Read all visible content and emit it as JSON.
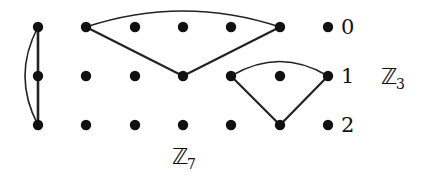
{
  "diagram": {
    "colors": {
      "background": "#ffffff",
      "ink": "#111111",
      "edge": "#222222"
    },
    "grid": {
      "columns_x": [
        38,
        86,
        135,
        183,
        231,
        280,
        328
      ],
      "rows_y": [
        27,
        76,
        125
      ],
      "dot_radius": 5.2
    },
    "row_labels": [
      "0",
      "1",
      "2"
    ],
    "group_labels": {
      "rows_group": {
        "symbol": "ℤ",
        "subscript": "3"
      },
      "columns_group": {
        "symbol": "ℤ",
        "subscript": "7"
      }
    },
    "edges": [
      {
        "type": "line",
        "from": [
          0,
          0
        ],
        "to": [
          0,
          1
        ]
      },
      {
        "type": "line",
        "from": [
          0,
          1
        ],
        "to": [
          0,
          2
        ]
      },
      {
        "type": "arc",
        "from": [
          0,
          0
        ],
        "to": [
          0,
          2
        ],
        "control": [
          12,
          76
        ]
      },
      {
        "type": "arc",
        "from": [
          1,
          0
        ],
        "to": [
          5,
          0
        ],
        "control": [
          183,
          -5
        ]
      },
      {
        "type": "line",
        "from": [
          1,
          0
        ],
        "to": [
          3,
          1
        ]
      },
      {
        "type": "line",
        "from": [
          3,
          1
        ],
        "to": [
          5,
          0
        ]
      },
      {
        "type": "arc",
        "from": [
          4,
          1
        ],
        "to": [
          6,
          1
        ],
        "control": [
          280,
          47
        ]
      },
      {
        "type": "line",
        "from": [
          4,
          1
        ],
        "to": [
          5,
          2
        ]
      },
      {
        "type": "line",
        "from": [
          5,
          2
        ],
        "to": [
          6,
          1
        ]
      }
    ]
  }
}
